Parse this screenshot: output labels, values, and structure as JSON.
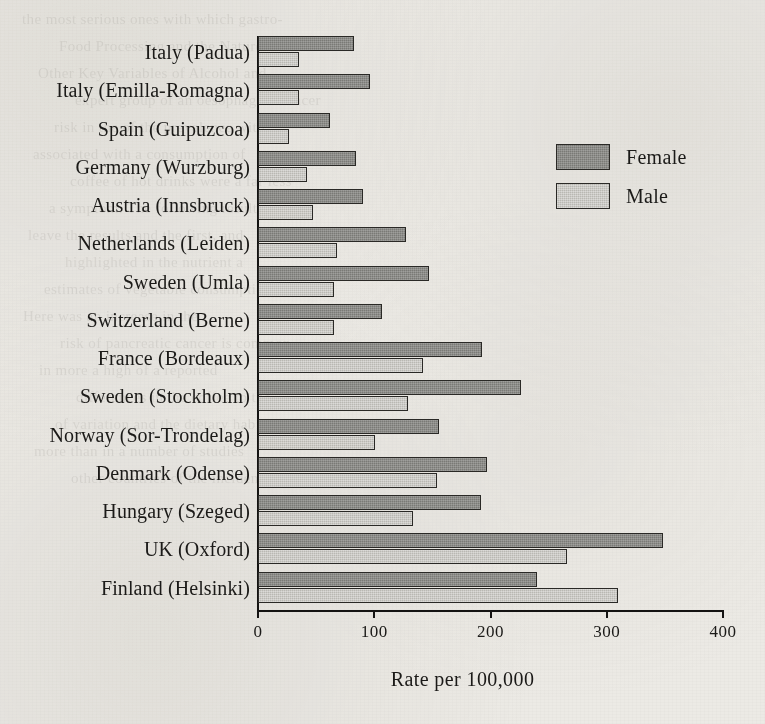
{
  "chart_data": {
    "type": "bar",
    "orientation": "horizontal",
    "title": "",
    "xlabel": "Rate per 100,000",
    "ylabel": "",
    "xlim": [
      0,
      400
    ],
    "xticks": [
      0,
      100,
      200,
      300,
      400
    ],
    "xtick_labels": [
      "0",
      "100",
      "200",
      "300",
      "400"
    ],
    "grid": false,
    "legend_position": "upper-right",
    "categories": [
      "Italy (Padua)",
      "Italy (Emilla-Romagna)",
      "Spain (Guipuzcoa)",
      "Germany (Wurzburg)",
      "Austria (Innsbruck)",
      "Netherlands (Leiden)",
      "Sweden (Umla)",
      "Switzerland (Berne)",
      "France (Bordeaux)",
      "Sweden (Stockholm)",
      "Norway (Sor-Trondelag)",
      "Denmark (Odense)",
      "Hungary (Szeged)",
      "UK (Oxford)",
      "Finland (Helsinki)"
    ],
    "series": [
      {
        "name": "Female",
        "color": "#7a7a76",
        "values": [
          83,
          96,
          62,
          84,
          90,
          127,
          147,
          107,
          193,
          226,
          156,
          197,
          192,
          348,
          240
        ]
      },
      {
        "name": "Male",
        "color": "#b9b8b2",
        "values": [
          35,
          35,
          27,
          42,
          47,
          68,
          65,
          65,
          142,
          129,
          101,
          154,
          133,
          266,
          310
        ]
      }
    ]
  },
  "legend": {
    "entries": [
      {
        "label": "Female",
        "swatch": "female"
      },
      {
        "label": "Male",
        "swatch": "male"
      }
    ]
  },
  "bleed_text": [
    "the most serious ones with which gastro-",
    "Food Processing and the Nature of",
    "Other Key Variables of Alcohol and",
    "expert group of an oesophageal cancer",
    "risk in the of the prevalence with",
    "associated with a consumption of",
    "coffee of hot drinks were a far less",
    "a symptom. The following results",
    "leave the results and the first, and",
    "highlighted in the nutrient a",
    "estimates of vegetable consumption",
    "Here was an increase in the",
    "risk of pancreatic cancer is common",
    "in more a high of a reported",
    "differences in the coffee to the",
    "of variation and the dietary habit",
    "more than in a number of studies",
    "other countries of the incidence"
  ]
}
